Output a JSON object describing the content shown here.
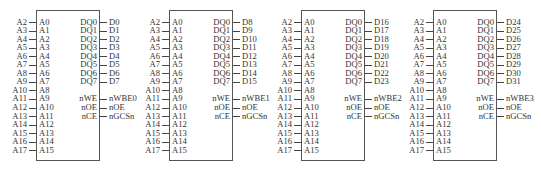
{
  "chips": [
    {
      "x": 36,
      "left_internal": [
        "A0",
        "A1",
        "A2",
        "A3",
        "A4",
        "A5",
        "A6",
        "A7",
        "A8",
        "A9",
        "A10",
        "A11",
        "A12",
        "A13",
        "A14",
        "A15"
      ],
      "left_external": [
        "A2",
        "A3",
        "A4",
        "A5",
        "A6",
        "A7",
        "A8",
        "A9",
        "A10",
        "A11",
        "A12",
        "A13",
        "A14",
        "A15",
        "A16",
        "A17"
      ],
      "right_internal": [
        "DQ0",
        "DQ1",
        "DQ2",
        "DQ3",
        "DQ4",
        "DQ5",
        "DQ6",
        "DQ7",
        "",
        "nWE",
        "nOE",
        "nCE"
      ],
      "right_external": [
        "D0",
        "D1",
        "D2",
        "D3",
        "D4",
        "D5",
        "D6",
        "D7",
        "",
        "nWBE0",
        "nOE",
        "nGCSn"
      ]
    },
    {
      "x": 169,
      "left_internal": [
        "A0",
        "A1",
        "A2",
        "A3",
        "A4",
        "A5",
        "A6",
        "A7",
        "A8",
        "A9",
        "A10",
        "A11",
        "A12",
        "A13",
        "A14",
        "A15"
      ],
      "left_external": [
        "A2",
        "A3",
        "A4",
        "A5",
        "A6",
        "A7",
        "A8",
        "A9",
        "A10",
        "A11",
        "A12",
        "A13",
        "A14",
        "A15",
        "A16",
        "A17"
      ],
      "right_internal": [
        "DQ0",
        "DQ1",
        "DQ2",
        "DQ3",
        "DQ4",
        "DQ5",
        "DQ6",
        "DQ7",
        "",
        "nWE",
        "nOE",
        "nCE"
      ],
      "right_external": [
        "D8",
        "D9",
        "D10",
        "D11",
        "D12",
        "D13",
        "D14",
        "D15",
        "",
        "nWBE1",
        "nOE",
        "nGCSn"
      ]
    },
    {
      "x": 301,
      "left_internal": [
        "A0",
        "A1",
        "A2",
        "A3",
        "A4",
        "A5",
        "A6",
        "A7",
        "A8",
        "A9",
        "A10",
        "A11",
        "A12",
        "A13",
        "A14",
        "A15"
      ],
      "left_external": [
        "A2",
        "A3",
        "A4",
        "A5",
        "A6",
        "A7",
        "A8",
        "A9",
        "A10",
        "A11",
        "A12",
        "A13",
        "A14",
        "A15",
        "A16",
        "A17"
      ],
      "right_internal": [
        "DQ0",
        "DQ1",
        "DQ2",
        "DQ3",
        "DQ4",
        "DQ5",
        "DQ6",
        "DQ7",
        "",
        "nWE",
        "nOE",
        "nCE"
      ],
      "right_external": [
        "D16",
        "D17",
        "D18",
        "D19",
        "D20",
        "D21",
        "D22",
        "D23",
        "",
        "nWBE2",
        "nOE",
        "nGCSn"
      ]
    },
    {
      "x": 433,
      "left_internal": [
        "A0",
        "A1",
        "A2",
        "A3",
        "A4",
        "A5",
        "A6",
        "A7",
        "A8",
        "A9",
        "A10",
        "A11",
        "A12",
        "A13",
        "A14",
        "A15"
      ],
      "left_external": [
        "A2",
        "A3",
        "A4",
        "A5",
        "A6",
        "A7",
        "A8",
        "A9",
        "A10",
        "A11",
        "A12",
        "A13",
        "A14",
        "A15",
        "A16",
        "A17"
      ],
      "right_internal": [
        "DQ0",
        "DQ1",
        "DQ2",
        "DQ3",
        "DQ4",
        "DQ5",
        "DQ6",
        "DQ7",
        "",
        "nWE",
        "nOE",
        "nCE"
      ],
      "right_external": [
        "D24",
        "D25",
        "D26",
        "D27",
        "D28",
        "D29",
        "D30",
        "D31",
        "",
        "nWBE3",
        "nOE",
        "nGCSn"
      ]
    }
  ]
}
